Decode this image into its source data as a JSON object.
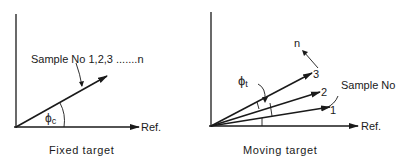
{
  "left_panel": {
    "caption": "Fixed target",
    "ref_label": "Ref.",
    "vector_label": "Sample No 1,2,3 .......n",
    "angle_symbol": "ϕ",
    "angle_subscript": "c"
  },
  "right_panel": {
    "caption": "Moving target",
    "ref_label": "Ref.",
    "sample_label": "Sample No",
    "vector_labels": [
      "1",
      "2",
      "3"
    ],
    "continuation_label": "n",
    "angle_symbol": "ϕ",
    "angle_subscript": "t"
  },
  "colors": {
    "ink": "#1a1a1a",
    "background": "#ffffff"
  }
}
